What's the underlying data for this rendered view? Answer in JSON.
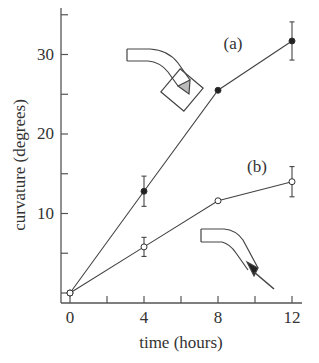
{
  "chart_data": {
    "type": "line",
    "title": "",
    "xlabel": "time (hours)",
    "ylabel": "curvature (degrees)",
    "xlim": [
      0,
      12
    ],
    "ylim": [
      -1,
      37
    ],
    "xticks": [
      0,
      4,
      8,
      12
    ],
    "xtick_labels": [
      "0",
      "4",
      "8",
      "12"
    ],
    "xminor_ticks": [
      2,
      6,
      10
    ],
    "yticks": [
      10,
      20,
      30
    ],
    "ytick_labels": [
      "10",
      "20",
      "30"
    ],
    "yminor_ticks": [
      0,
      5,
      15,
      25,
      35
    ],
    "grid": false,
    "legend": "inline labels",
    "x": [
      0,
      4,
      8,
      12
    ],
    "series": [
      {
        "name": "(a)",
        "marker": "filled-circle",
        "values": [
          0,
          12.8,
          25.5,
          31.7
        ],
        "errors": [
          0,
          1.9,
          0,
          2.4
        ]
      },
      {
        "name": "(b)",
        "marker": "open-circle",
        "values": [
          0,
          5.8,
          11.6,
          14.0
        ],
        "errors": [
          0,
          1.2,
          0,
          1.9
        ]
      }
    ],
    "annotations": [
      {
        "text": "(a)",
        "x": 8.6,
        "y": 31,
        "note": "label for filled-circle series; inset sketch of bent tube with pointed tip inside a tilted square"
      },
      {
        "text": "(b)",
        "x": 8.6,
        "y": 17.5,
        "note": "label for open-circle series; inset sketch of bent tube with tapered tip extending outward"
      }
    ]
  },
  "labels": {
    "series_a": "(a)",
    "series_b": "(b)",
    "xlabel": "time (hours)",
    "ylabel": "curvature (degrees)",
    "xticks": [
      "0",
      "4",
      "8",
      "12"
    ],
    "yticks": [
      "10",
      "20",
      "30"
    ]
  },
  "colors": {
    "ink": "#333333",
    "axis": "#555555",
    "background": "#ffffff"
  }
}
